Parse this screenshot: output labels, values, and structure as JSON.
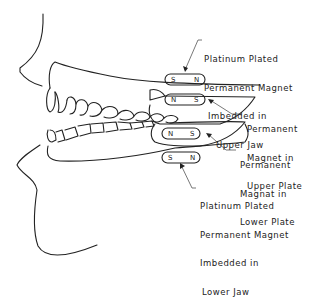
{
  "diagram": {
    "type": "side-profile dental diagram",
    "labels": {
      "upper_jaw_magnet": [
        "Platinum Plated",
        "Permanent Magnet",
        "Imbedded in",
        "Upper Jaw"
      ],
      "upper_plate_magnet": [
        "Permanent",
        "Magnet in",
        "Upper Plate"
      ],
      "lower_plate_magnet": [
        "Permanent",
        "Magnat in",
        "Lower Plate"
      ],
      "lower_jaw_magnet": [
        "Platinum Plated",
        "Permanent Magnet",
        "Imbedded in",
        "Lower Jaw"
      ]
    },
    "magnets": {
      "upper_jaw": {
        "left": "S",
        "right": "N"
      },
      "upper_plate": {
        "left": "N",
        "right": "S"
      },
      "lower_plate": {
        "left": "N",
        "right": "S"
      },
      "lower_jaw": {
        "left": "S",
        "right": "N"
      }
    },
    "stroke_color": "#222222",
    "leader_color": "#555555"
  }
}
